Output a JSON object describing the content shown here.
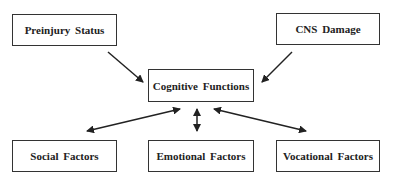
{
  "diagram": {
    "nodes": {
      "preinjury": {
        "label": "Preinjury Status"
      },
      "cns": {
        "label": "CNS Damage"
      },
      "cognitive": {
        "label": "Cognitive Functions"
      },
      "social": {
        "label": "Social Factors"
      },
      "emotional": {
        "label": "Emotional Factors"
      },
      "vocational": {
        "label": "Vocational Factors"
      }
    },
    "edges": [
      {
        "from": "Preinjury Status",
        "to": "Cognitive Functions",
        "type": "one-way"
      },
      {
        "from": "CNS Damage",
        "to": "Cognitive Functions",
        "type": "one-way"
      },
      {
        "from": "Cognitive Functions",
        "to": "Social Factors",
        "type": "two-way"
      },
      {
        "from": "Cognitive Functions",
        "to": "Emotional Factors",
        "type": "two-way"
      },
      {
        "from": "Cognitive Functions",
        "to": "Vocational Factors",
        "type": "two-way"
      }
    ]
  }
}
